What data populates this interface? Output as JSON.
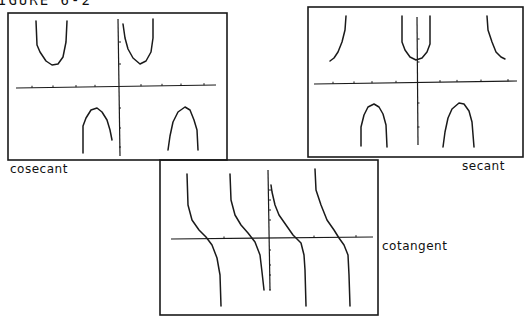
{
  "header": {
    "text": "IGURE 6-2"
  },
  "panels": [
    {
      "id": "cosecant",
      "label": "cosecant",
      "frame": [
        8,
        13,
        227,
        160
      ],
      "label_pos": [
        10,
        174
      ],
      "axes": {
        "x_axis": [
          [
            16,
            88
          ],
          [
            216,
            85
          ]
        ],
        "y_axis": [
          [
            118,
            19
          ],
          [
            120,
            156
          ]
        ]
      },
      "x_ticks": [
        32,
        53,
        76,
        95,
        141,
        162,
        181,
        204
      ],
      "y_ticks": [
        42,
        64,
        108,
        128,
        147
      ],
      "curves": [
        [
          [
            36,
            21
          ],
          [
            37,
            45
          ],
          [
            40,
            52
          ],
          [
            46,
            61
          ],
          [
            52,
            65
          ],
          [
            58,
            64
          ],
          [
            63,
            57
          ],
          [
            66,
            42
          ],
          [
            67,
            21
          ]
        ],
        [
          [
            123,
            24
          ],
          [
            125,
            38
          ],
          [
            128,
            49
          ],
          [
            133,
            58
          ],
          [
            140,
            64
          ],
          [
            146,
            61
          ],
          [
            151,
            52
          ],
          [
            153,
            38
          ],
          [
            153,
            19
          ]
        ],
        [
          [
            83,
            153
          ],
          [
            83,
            126
          ],
          [
            86,
            118
          ],
          [
            91,
            110
          ],
          [
            97,
            108
          ],
          [
            102,
            112
          ],
          [
            107,
            120
          ],
          [
            110,
            130
          ],
          [
            112,
            140
          ]
        ],
        [
          [
            168,
            150
          ],
          [
            170,
            136
          ],
          [
            173,
            122
          ],
          [
            178,
            112
          ],
          [
            185,
            107
          ],
          [
            190,
            110
          ],
          [
            194,
            120
          ],
          [
            197,
            130
          ],
          [
            198,
            150
          ]
        ]
      ]
    },
    {
      "id": "secant",
      "label": "secant",
      "frame": [
        308,
        7,
        523,
        157
      ],
      "label_pos": [
        462,
        171
      ],
      "axes": {
        "x_axis": [
          [
            314,
            84
          ],
          [
            517,
            81
          ]
        ],
        "y_axis": [
          [
            417,
            17
          ],
          [
            418,
            145
          ]
        ]
      },
      "x_ticks": [
        333,
        354,
        372,
        396,
        440,
        457,
        481,
        508
      ],
      "y_ticks": [
        39,
        62,
        103,
        127
      ],
      "curves": [
        [
          [
            346,
            16
          ],
          [
            345,
            30
          ],
          [
            342,
            42
          ],
          [
            338,
            52
          ],
          [
            334,
            58
          ],
          [
            330,
            61
          ]
        ],
        [
          [
            402,
            16
          ],
          [
            402,
            42
          ],
          [
            405,
            50
          ],
          [
            410,
            57
          ],
          [
            416,
            60
          ],
          [
            422,
            58
          ],
          [
            427,
            52
          ],
          [
            430,
            44
          ],
          [
            430,
            16
          ]
        ],
        [
          [
            487,
            16
          ],
          [
            488,
            30
          ],
          [
            492,
            42
          ],
          [
            496,
            52
          ],
          [
            501,
            57
          ],
          [
            505,
            59
          ]
        ],
        [
          [
            361,
            146
          ],
          [
            361,
            127
          ],
          [
            364,
            115
          ],
          [
            368,
            107
          ],
          [
            374,
            104
          ],
          [
            379,
            107
          ],
          [
            383,
            114
          ],
          [
            386,
            125
          ],
          [
            387,
            147
          ]
        ],
        [
          [
            443,
            147
          ],
          [
            445,
            132
          ],
          [
            448,
            118
          ],
          [
            452,
            109
          ],
          [
            459,
            103
          ],
          [
            464,
            104
          ],
          [
            469,
            111
          ],
          [
            472,
            122
          ],
          [
            474,
            147
          ]
        ]
      ]
    },
    {
      "id": "cotangent",
      "label": "cotangent",
      "frame": [
        160,
        160,
        378,
        315
      ],
      "label_pos": [
        382,
        251
      ],
      "axes": {
        "x_axis": [
          [
            171,
            239
          ],
          [
            373,
            237
          ]
        ],
        "y_axis": [
          [
            268,
            170
          ],
          [
            270,
            290
          ]
        ]
      },
      "x_ticks": [
        224,
        314,
        356
      ],
      "y_ticks": [
        190,
        200,
        210,
        220,
        250,
        265,
        275,
        290
      ],
      "curves": [
        [
          [
            187,
            174
          ],
          [
            188,
            205
          ],
          [
            192,
            220
          ],
          [
            199,
            230
          ],
          [
            206,
            237
          ],
          [
            212,
            245
          ],
          [
            217,
            258
          ],
          [
            220,
            275
          ],
          [
            221,
            306
          ]
        ],
        [
          [
            230,
            174
          ],
          [
            231,
            200
          ],
          [
            235,
            215
          ],
          [
            241,
            225
          ],
          [
            248,
            233
          ],
          [
            255,
            242
          ],
          [
            260,
            255
          ],
          [
            262,
            272
          ],
          [
            264,
            290
          ]
        ],
        [
          [
            271,
            185
          ],
          [
            272,
            192
          ],
          [
            275,
            205
          ],
          [
            279,
            215
          ],
          [
            286,
            225
          ],
          [
            293,
            235
          ],
          [
            301,
            243
          ],
          [
            304,
            255
          ],
          [
            305,
            270
          ],
          [
            306,
            306
          ]
        ],
        [
          [
            315,
            169
          ],
          [
            316,
            190
          ],
          [
            321,
            205
          ],
          [
            327,
            220
          ],
          [
            334,
            230
          ],
          [
            339,
            238
          ],
          [
            344,
            245
          ],
          [
            348,
            255
          ],
          [
            349,
            275
          ],
          [
            350,
            306
          ]
        ]
      ]
    }
  ],
  "styles": {
    "stroke": "#1a1a1a",
    "background": "#ffffff"
  }
}
